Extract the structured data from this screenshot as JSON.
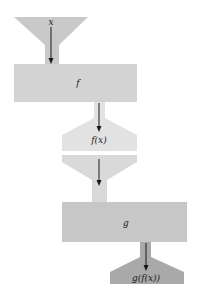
{
  "diagram": {
    "type": "function-machine-composition",
    "stages": [
      {
        "id": "input",
        "label": "x",
        "color": "#c9c9c9"
      },
      {
        "id": "machine_f",
        "label": "f",
        "color": "#d3d3d3"
      },
      {
        "id": "output_f",
        "label": "f(x)",
        "color": "#e2e2e2"
      },
      {
        "id": "input_g",
        "label": "",
        "color": "#d9d9d9"
      },
      {
        "id": "machine_g",
        "label": "g",
        "color": "#c7c7c7"
      },
      {
        "id": "output_g",
        "label": "g(f(x))",
        "color": "#a9a9a9"
      }
    ]
  }
}
